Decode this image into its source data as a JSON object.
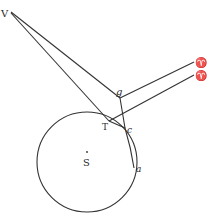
{
  "diagram": {
    "type": "geometric-astronomy",
    "stroke_color": "#333333",
    "labels": {
      "V": "V",
      "g": "g",
      "T": "T",
      "c": "c",
      "a": "a",
      "S": "S",
      "aries_upper": "♈",
      "aries_lower": "♈"
    },
    "points": {
      "V": [
        10,
        12
      ],
      "g": [
        120,
        98
      ],
      "T": [
        109,
        121
      ],
      "c": [
        125,
        128
      ],
      "a": [
        134,
        168
      ],
      "S": [
        87,
        160
      ],
      "aries_upper": [
        195,
        62
      ],
      "aries_lower": [
        195,
        75
      ]
    },
    "circle": {
      "center": [
        87,
        162
      ],
      "radius": 50
    }
  }
}
